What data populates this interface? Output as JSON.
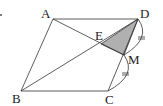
{
  "diagram": {
    "points": {
      "A": {
        "label": "A",
        "x": 53,
        "y": 19
      },
      "B": {
        "label": "B",
        "x": 21,
        "y": 91
      },
      "C": {
        "label": "C",
        "x": 108,
        "y": 91
      },
      "D": {
        "label": "D",
        "x": 138,
        "y": 19
      },
      "E": {
        "label": "E",
        "x": 101,
        "y": 44
      },
      "M": {
        "label": "M",
        "x": 124,
        "y": 55
      }
    },
    "segments": [
      "AD",
      "BC",
      "AB",
      "CD",
      "BD",
      "AM"
    ],
    "shaded_region": [
      "E",
      "D",
      "M"
    ],
    "shade_color": "#b0b0b0",
    "equal_marks": [
      "DM",
      "MC"
    ],
    "equal_mark_glyph": "="
  }
}
